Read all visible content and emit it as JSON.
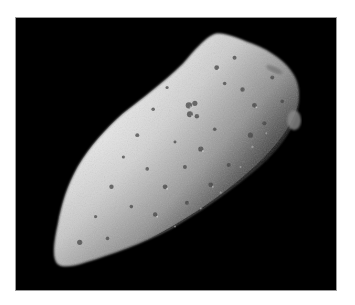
{
  "image": {
    "subject": "asteroid",
    "description": "Grayscale photograph of a cratered, elongated asteroid lit from the upper left against a black space background",
    "background_color": "#000000",
    "border_color": "#ffffff",
    "colors": {
      "highlight": "#e6e6e6",
      "midtone": "#9a9a9a",
      "shadow": "#2a2a2a",
      "space": "#000000"
    }
  }
}
